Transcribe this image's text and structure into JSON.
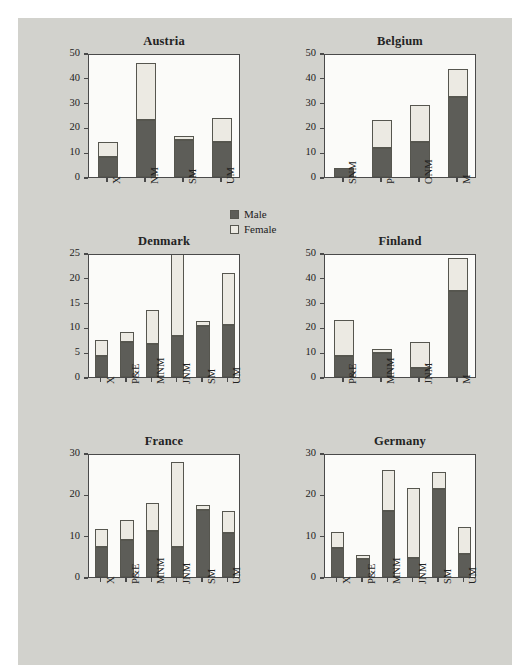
{
  "figure": {
    "background_color": "#d2d2cd",
    "panel_background_color": "#fbfbf9",
    "axis_color": "#4a4a4a"
  },
  "legend": {
    "position": "center-middle",
    "entries": [
      {
        "label": "Male",
        "color": "#5d5d58"
      },
      {
        "label": "Female",
        "color": "#eceae3"
      }
    ]
  },
  "chart_data": {
    "type": "bar",
    "title": "",
    "subtitle": "",
    "stacked": true,
    "grid": false,
    "xlabel": "",
    "ylabel": "",
    "legend_position": "center-middle",
    "legend_entries": [
      "Male",
      "Female"
    ],
    "series_names": [
      "Male",
      "Female"
    ],
    "series_colors": [
      "#5d5d58",
      "#eceae3"
    ],
    "panels": [
      {
        "title": "Austria",
        "categories": [
          "X",
          "NM",
          "SM",
          "UM"
        ],
        "ylim": [
          0,
          50
        ],
        "yticks": [
          0,
          10,
          20,
          30,
          40,
          50
        ],
        "series": [
          {
            "name": "Male",
            "values": [
              8.2,
              22.8,
              15.0,
              14.2
            ]
          },
          {
            "name": "Female",
            "values": [
              6.0,
              23.2,
              1.7,
              9.6
            ]
          }
        ],
        "totals": [
          14.2,
          46.0,
          16.7,
          23.8
        ]
      },
      {
        "title": "Belgium",
        "categories": [
          "SNM",
          "P",
          "ONM",
          "M"
        ],
        "ylim": [
          0,
          50
        ],
        "yticks": [
          0,
          10,
          20,
          30,
          40,
          50
        ],
        "series": [
          {
            "name": "Male",
            "values": [
              3.5,
              11.5,
              14.1,
              32.4
            ]
          },
          {
            "name": "Female",
            "values": [
              0.0,
              11.3,
              15.0,
              11.1
            ]
          }
        ],
        "totals": [
          3.5,
          22.8,
          29.1,
          43.5
        ]
      },
      {
        "title": "Denmark",
        "categories": [
          "X",
          "P&E",
          "MNM",
          "JNM",
          "SM",
          "UM"
        ],
        "ylim": [
          0,
          25
        ],
        "yticks": [
          0,
          5,
          10,
          15,
          20,
          25
        ],
        "series": [
          {
            "name": "Male",
            "values": [
              4.3,
              7.0,
              6.6,
              8.3,
              10.3,
              10.4
            ]
          },
          {
            "name": "Female",
            "values": [
              3.2,
              2.0,
              6.9,
              17.2,
              1.0,
              10.6
            ]
          }
        ],
        "totals": [
          7.5,
          9.0,
          13.5,
          25.5,
          11.3,
          21.0
        ],
        "clipped_bars": [
          "JNM"
        ]
      },
      {
        "title": "Finland",
        "categories": [
          "P&E",
          "MNM",
          "JNM",
          "M"
        ],
        "ylim": [
          0,
          50
        ],
        "yticks": [
          0,
          10,
          20,
          30,
          40,
          50
        ],
        "series": [
          {
            "name": "Male",
            "values": [
              8.3,
              9.7,
              3.5,
              34.8
            ]
          },
          {
            "name": "Female",
            "values": [
              14.7,
              1.6,
              10.5,
              13.2
            ]
          }
        ],
        "totals": [
          23.0,
          11.3,
          14.0,
          48.0
        ]
      },
      {
        "title": "France",
        "categories": [
          "X",
          "P&E",
          "MNM",
          "JNM",
          "SM",
          "UM"
        ],
        "ylim": [
          0,
          30
        ],
        "yticks": [
          0,
          10,
          20,
          30
        ],
        "series": [
          {
            "name": "Male",
            "values": [
              7.3,
              9.0,
              11.2,
              7.2,
              16.3,
              10.7
            ]
          },
          {
            "name": "Female",
            "values": [
              4.2,
              4.7,
              6.8,
              20.6,
              1.2,
              5.3
            ]
          }
        ],
        "totals": [
          11.5,
          13.7,
          18.0,
          27.8,
          17.5,
          16.0
        ]
      },
      {
        "title": "Germany",
        "categories": [
          "X",
          "P&E",
          "MNM",
          "JNM",
          "SM",
          "UM"
        ],
        "ylim": [
          0,
          30
        ],
        "yticks": [
          0,
          10,
          20,
          30
        ],
        "series": [
          {
            "name": "Male",
            "values": [
              7.0,
              4.3,
              16.0,
              4.7,
              21.3,
              5.5
            ]
          },
          {
            "name": "Female",
            "values": [
              4.0,
              1.0,
              10.0,
              16.9,
              4.0,
              6.5
            ]
          }
        ],
        "totals": [
          11.0,
          5.3,
          26.0,
          21.6,
          25.3,
          12.0
        ]
      }
    ]
  }
}
